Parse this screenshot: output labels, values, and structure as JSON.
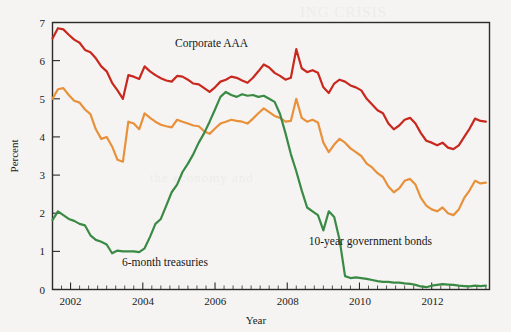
{
  "figure": {
    "background_color": "#f5f4f2",
    "axis_color": "#2b2b2b"
  },
  "axes": {
    "y_title": "Percent",
    "x_title": "Year",
    "y_ticks": [
      "0",
      "1",
      "2",
      "3",
      "4",
      "5",
      "6",
      "7"
    ],
    "x_ticks": [
      "2002",
      "2004",
      "2006",
      "2008",
      "2010",
      "2012"
    ]
  },
  "annotations": {
    "corporate": "Corporate AAA",
    "treasuries": "6-month treasuries",
    "government": "10-year government bonds"
  },
  "chart_data": {
    "type": "line",
    "title": "",
    "xlabel": "Year",
    "ylabel": "Percent",
    "xlim": [
      2001.5,
      2013.6
    ],
    "ylim": [
      0,
      7
    ],
    "grid": false,
    "legend": "inline annotations",
    "x": [
      2001.5,
      2001.65,
      2001.8,
      2001.95,
      2002.1,
      2002.25,
      2002.4,
      2002.55,
      2002.7,
      2002.85,
      2003.0,
      2003.15,
      2003.3,
      2003.45,
      2003.6,
      2003.75,
      2003.9,
      2004.05,
      2004.2,
      2004.35,
      2004.5,
      2004.65,
      2004.8,
      2004.95,
      2005.1,
      2005.25,
      2005.4,
      2005.55,
      2005.7,
      2005.85,
      2006.0,
      2006.15,
      2006.3,
      2006.45,
      2006.6,
      2006.75,
      2006.9,
      2007.05,
      2007.2,
      2007.35,
      2007.5,
      2007.65,
      2007.8,
      2007.95,
      2008.1,
      2008.25,
      2008.4,
      2008.55,
      2008.7,
      2008.85,
      2009.0,
      2009.15,
      2009.3,
      2009.45,
      2009.6,
      2009.75,
      2009.9,
      2010.05,
      2010.2,
      2010.35,
      2010.5,
      2010.65,
      2010.8,
      2010.95,
      2011.1,
      2011.25,
      2011.4,
      2011.55,
      2011.7,
      2011.85,
      2012.0,
      2012.15,
      2012.3,
      2012.45,
      2012.6,
      2012.75,
      2012.9,
      2013.05,
      2013.2,
      2013.35,
      2013.5
    ],
    "series": [
      {
        "name": "Corporate AAA",
        "color": "#c8281e",
        "values": [
          6.58,
          6.85,
          6.82,
          6.68,
          6.55,
          6.47,
          6.28,
          6.22,
          6.06,
          5.85,
          5.72,
          5.42,
          5.22,
          5.0,
          5.62,
          5.58,
          5.52,
          5.85,
          5.72,
          5.62,
          5.54,
          5.48,
          5.45,
          5.6,
          5.58,
          5.5,
          5.4,
          5.38,
          5.28,
          5.18,
          5.3,
          5.45,
          5.5,
          5.58,
          5.55,
          5.48,
          5.42,
          5.55,
          5.72,
          5.9,
          5.82,
          5.68,
          5.6,
          5.5,
          5.55,
          6.3,
          5.8,
          5.7,
          5.75,
          5.68,
          5.3,
          5.15,
          5.4,
          5.5,
          5.45,
          5.35,
          5.3,
          5.22,
          5.0,
          4.85,
          4.7,
          4.62,
          4.35,
          4.2,
          4.3,
          4.45,
          4.5,
          4.35,
          4.1,
          3.9,
          3.85,
          3.78,
          3.85,
          3.72,
          3.68,
          3.78,
          4.0,
          4.22,
          4.48,
          4.42,
          4.4
        ]
      },
      {
        "name": "10-year government bonds",
        "color": "#e8913a",
        "values": [
          5.0,
          5.25,
          5.28,
          5.1,
          4.95,
          4.9,
          4.72,
          4.6,
          4.2,
          3.95,
          4.0,
          3.75,
          3.4,
          3.35,
          4.4,
          4.35,
          4.2,
          4.62,
          4.5,
          4.4,
          4.32,
          4.28,
          4.25,
          4.45,
          4.4,
          4.35,
          4.3,
          4.28,
          4.15,
          4.08,
          4.22,
          4.35,
          4.4,
          4.45,
          4.42,
          4.4,
          4.35,
          4.48,
          4.62,
          4.75,
          4.65,
          4.55,
          4.5,
          4.4,
          4.42,
          5.0,
          4.5,
          4.4,
          4.45,
          4.38,
          3.85,
          3.6,
          3.8,
          3.95,
          3.85,
          3.7,
          3.6,
          3.5,
          3.3,
          3.2,
          3.05,
          2.95,
          2.7,
          2.55,
          2.65,
          2.85,
          2.9,
          2.75,
          2.4,
          2.2,
          2.1,
          2.05,
          2.15,
          2.0,
          1.95,
          2.1,
          2.4,
          2.6,
          2.85,
          2.78,
          2.8
        ]
      },
      {
        "name": "6-month treasuries",
        "color": "#3a8a45",
        "values": [
          1.82,
          2.05,
          1.95,
          1.85,
          1.8,
          1.72,
          1.68,
          1.42,
          1.3,
          1.25,
          1.18,
          0.95,
          1.02,
          1.0,
          1.0,
          1.0,
          0.98,
          1.08,
          1.38,
          1.72,
          1.85,
          2.2,
          2.55,
          2.75,
          3.08,
          3.3,
          3.55,
          3.85,
          4.1,
          4.4,
          4.72,
          5.05,
          5.18,
          5.1,
          5.05,
          5.12,
          5.08,
          5.1,
          5.05,
          5.08,
          5.0,
          4.92,
          4.6,
          4.1,
          3.55,
          3.1,
          2.6,
          2.15,
          2.05,
          1.95,
          1.55,
          2.05,
          1.9,
          1.3,
          0.35,
          0.3,
          0.32,
          0.3,
          0.28,
          0.25,
          0.22,
          0.2,
          0.2,
          0.18,
          0.18,
          0.16,
          0.15,
          0.12,
          0.08,
          0.06,
          0.1,
          0.12,
          0.14,
          0.13,
          0.12,
          0.1,
          0.09,
          0.08,
          0.1,
          0.09,
          0.1
        ]
      }
    ]
  }
}
